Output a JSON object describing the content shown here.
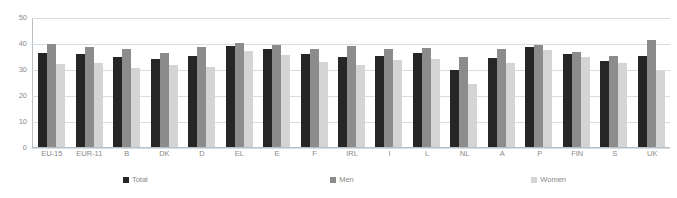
{
  "chart_data": {
    "type": "bar",
    "title": "",
    "xlabel": "",
    "ylabel": "",
    "ylim": [
      0,
      50
    ],
    "yticks": [
      0,
      10,
      20,
      30,
      40,
      50
    ],
    "grid": true,
    "legend_position": "bottom",
    "categories": [
      "EU-15",
      "EUR-11",
      "B",
      "DK",
      "D",
      "EL",
      "E",
      "F",
      "IRL",
      "I",
      "L",
      "NL",
      "A",
      "P",
      "FIN",
      "S",
      "UK"
    ],
    "series": [
      {
        "name": "Total",
        "color": "#262626",
        "values": [
          36.3,
          35.9,
          34.8,
          34.1,
          35.2,
          39.1,
          38.1,
          36.0,
          34.9,
          35.2,
          36.5,
          30.0,
          34.5,
          38.7,
          36.1,
          33.4,
          35.3
        ]
      },
      {
        "name": "Men",
        "color": "#8C8C8C",
        "values": [
          39.8,
          38.9,
          37.9,
          36.3,
          38.8,
          40.4,
          39.4,
          38.0,
          39.3,
          37.8,
          38.3,
          35.0,
          37.8,
          39.5,
          37.0,
          35.2,
          41.6
        ]
      },
      {
        "name": "Women",
        "color": "#D4D4D4",
        "values": [
          32.1,
          32.4,
          30.6,
          31.9,
          30.9,
          37.2,
          35.6,
          33.1,
          31.6,
          33.6,
          34.1,
          24.5,
          32.7,
          37.5,
          34.9,
          32.6,
          29.4
        ]
      }
    ],
    "legend": [
      "Total",
      "Men",
      "Women"
    ]
  },
  "axis": {
    "y_tick_labels": [
      "50",
      "40",
      "30",
      "20",
      "10",
      "0"
    ]
  }
}
